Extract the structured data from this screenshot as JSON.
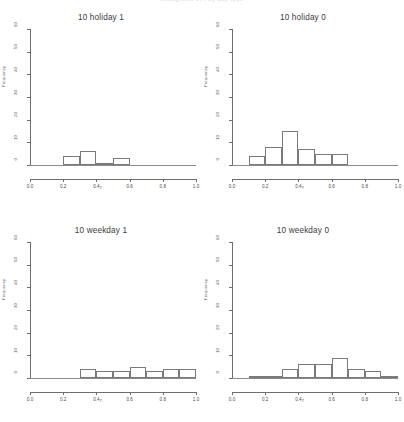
{
  "figure": {
    "header_faint": "histograms of r by day type",
    "background_color": "#ffffff",
    "line_color": "#6e6e6e",
    "bar_outline_color": "#7a7a7a",
    "text_color": "#3c3c3c"
  },
  "axes": {
    "ylabel": "Frequency",
    "xlabel": "r",
    "y_ticks": [
      "0",
      "10",
      "20",
      "30",
      "40",
      "50",
      "60"
    ],
    "x_ticks": [
      "0.0",
      "0.2",
      "0.4",
      "0.6",
      "0.8",
      "1.0"
    ]
  },
  "panels": [
    {
      "title": "10 holiday 1"
    },
    {
      "title": "10 holiday 0"
    },
    {
      "title": "10 weekday 1"
    },
    {
      "title": "10 weekday 0"
    }
  ],
  "chart_data": [
    {
      "type": "bar",
      "title": "10 holiday 1",
      "xlabel": "r",
      "ylabel": "Frequency",
      "xlim": [
        0.0,
        1.0
      ],
      "ylim": [
        0,
        60
      ],
      "bin_width": 0.1,
      "bin_starts": [
        0.2,
        0.3,
        0.4,
        0.5
      ],
      "categories": [
        "0.2-0.3",
        "0.3-0.4",
        "0.4-0.5",
        "0.5-0.6"
      ],
      "values": [
        4,
        6,
        1,
        3
      ],
      "grid": false,
      "legend": false
    },
    {
      "type": "bar",
      "title": "10 holiday 0",
      "xlabel": "r",
      "ylabel": "Frequency",
      "xlim": [
        0.0,
        1.0
      ],
      "ylim": [
        0,
        60
      ],
      "bin_width": 0.1,
      "bin_starts": [
        0.1,
        0.2,
        0.3,
        0.4,
        0.5,
        0.6
      ],
      "categories": [
        "0.1-0.2",
        "0.2-0.3",
        "0.3-0.4",
        "0.4-0.5",
        "0.5-0.6",
        "0.6-0.7"
      ],
      "values": [
        4,
        8,
        15,
        7,
        5,
        5
      ],
      "grid": false,
      "legend": false
    },
    {
      "type": "bar",
      "title": "10 weekday 1",
      "xlabel": "r",
      "ylabel": "Frequency",
      "xlim": [
        0.0,
        1.0
      ],
      "ylim": [
        0,
        60
      ],
      "bin_width": 0.1,
      "bin_starts": [
        0.3,
        0.4,
        0.5,
        0.6,
        0.7,
        0.8,
        0.9
      ],
      "categories": [
        "0.3-0.4",
        "0.4-0.5",
        "0.5-0.6",
        "0.6-0.7",
        "0.7-0.8",
        "0.8-0.9",
        "0.9-1.0"
      ],
      "values": [
        4,
        3,
        3,
        5,
        3,
        4,
        4
      ],
      "grid": false,
      "legend": false
    },
    {
      "type": "bar",
      "title": "10 weekday 0",
      "xlabel": "r",
      "ylabel": "Frequency",
      "xlim": [
        0.0,
        1.0
      ],
      "ylim": [
        0,
        60
      ],
      "bin_width": 0.1,
      "bin_starts": [
        0.1,
        0.2,
        0.3,
        0.4,
        0.5,
        0.6,
        0.7,
        0.8,
        0.9
      ],
      "categories": [
        "0.1-0.2",
        "0.2-0.3",
        "0.3-0.4",
        "0.4-0.5",
        "0.5-0.6",
        "0.6-0.7",
        "0.7-0.8",
        "0.8-0.9",
        "0.9-1.0"
      ],
      "values": [
        1,
        1,
        4,
        6,
        6,
        9,
        4,
        3,
        1
      ],
      "grid": false,
      "legend": false
    }
  ]
}
